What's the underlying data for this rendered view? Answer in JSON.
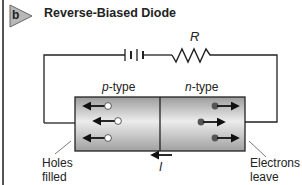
{
  "figure": {
    "panel_letter": "b",
    "title": "Reverse-Biased Diode"
  },
  "circuit": {
    "resistor_label": "R",
    "battery": "battery-symbol",
    "current_label": "I",
    "current_direction": "left"
  },
  "diode": {
    "p_region": {
      "label_prefix": "p",
      "label_suffix": "-type",
      "carriers": "holes",
      "carrier_count": 3,
      "motion": "left"
    },
    "n_region": {
      "label_prefix": "n",
      "label_suffix": "-type",
      "carriers": "electrons",
      "carrier_count": 3,
      "motion": "right"
    }
  },
  "annotations": {
    "left": {
      "line1": "Holes",
      "line2": "filled"
    },
    "right": {
      "line1": "Electrons",
      "line2": "leave"
    }
  },
  "colors": {
    "badge_fill": "#b8b8b8",
    "wire": "#222222",
    "diode_gradient_light": "#ececec",
    "diode_gradient_dark": "#9a9a9a"
  }
}
